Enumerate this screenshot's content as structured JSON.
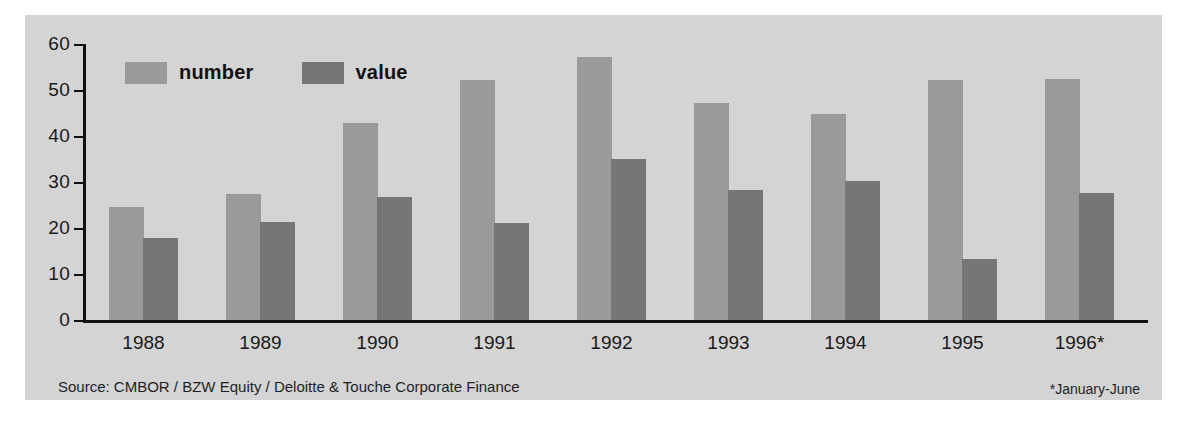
{
  "figure": {
    "panel_background": "#d4d4d4",
    "page_background": "#ffffff"
  },
  "legend": {
    "position": "top-left-inside",
    "items": [
      {
        "label": "number",
        "color": "#9a9a9a",
        "swatch_name": "legend-swatch-number"
      },
      {
        "label": "value",
        "color": "#767676",
        "swatch_name": "legend-swatch-value"
      }
    ]
  },
  "notes": {
    "source": "Source: CMBOR / BZW Equity / Deloitte & Touche Corporate Finance",
    "footnote": "*January-June"
  },
  "chart_data": {
    "type": "bar",
    "title": "",
    "subtitle": "",
    "xlabel": "",
    "ylabel": "",
    "ylim": [
      0,
      60
    ],
    "yticks": [
      0,
      10,
      20,
      30,
      40,
      50,
      60
    ],
    "ytick_labels": [
      "0",
      "10",
      "20",
      "30",
      "40",
      "50",
      "60"
    ],
    "grid": false,
    "legend_position": "top-left",
    "categories": [
      "1988",
      "1989",
      "1990",
      "1991",
      "1992",
      "1993",
      "1994",
      "1995",
      "1996*"
    ],
    "series": [
      {
        "name": "number",
        "color": "#9a9a9a",
        "values": [
          24.5,
          27.3,
          42.8,
          52.2,
          57.2,
          47.2,
          44.8,
          52.2,
          52.5
        ]
      },
      {
        "name": "value",
        "color": "#767676",
        "values": [
          17.8,
          21.2,
          26.8,
          21.0,
          35.0,
          28.2,
          30.3,
          13.2,
          27.7
        ]
      }
    ],
    "annotations": [
      "*January-June"
    ]
  }
}
